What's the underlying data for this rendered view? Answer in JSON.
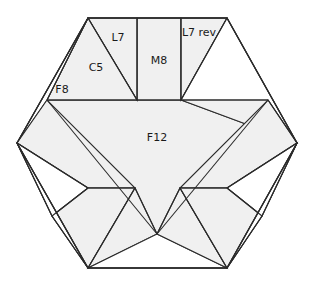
{
  "diagram": {
    "type": "hexagon-patchwork",
    "canvas": {
      "width": 314,
      "height": 287
    },
    "colors": {
      "background": "#ffffff",
      "piece_fill": "#f0f0f0",
      "piece_blank": "#ffffff",
      "stroke": "#2b2b2b",
      "label_text": "#1a1a1a"
    },
    "hexagon": {
      "center": {
        "x": 157,
        "y": 143
      },
      "vertices": [
        {
          "name": "left",
          "x": 17,
          "y": 143
        },
        {
          "name": "top-left",
          "x": 88,
          "y": 18
        },
        {
          "name": "top-right",
          "x": 227,
          "y": 18
        },
        {
          "name": "right",
          "x": 297,
          "y": 143
        },
        {
          "name": "bottom-right",
          "x": 227,
          "y": 268
        },
        {
          "name": "bottom-left",
          "x": 88,
          "y": 268
        }
      ]
    },
    "labels": [
      {
        "id": "l7",
        "text": "L7",
        "x": 118,
        "y": 38,
        "font_size": 11
      },
      {
        "id": "m8",
        "text": "M8",
        "x": 159,
        "y": 61,
        "font_size": 11
      },
      {
        "id": "l7rev",
        "text": "L7 rev",
        "x": 199,
        "y": 33,
        "font_size": 11
      },
      {
        "id": "c5",
        "text": "C5",
        "x": 96,
        "y": 68,
        "font_size": 11
      },
      {
        "id": "f8",
        "text": "F8",
        "x": 62,
        "y": 90,
        "font_size": 11
      },
      {
        "id": "f12",
        "text": "F12",
        "x": 157,
        "y": 138,
        "font_size": 11
      }
    ],
    "pieces": [
      {
        "id": "f12-center",
        "name": "F12 center triangle",
        "fill": "filled",
        "points": "47,100 268,100 157,234"
      },
      {
        "id": "m8-rect",
        "name": "M8 rectangle",
        "fill": "filled",
        "points": "137,18 181,18 181,100 137,100"
      },
      {
        "id": "l7-tri",
        "name": "L7 triangle",
        "fill": "filled",
        "points": "88,18 137,18 137,100"
      },
      {
        "id": "l7rev-tri",
        "name": "L7 reverse triangle",
        "fill": "filled",
        "points": "181,18 227,18 181,100"
      },
      {
        "id": "c5-tri",
        "name": "C5 triangle",
        "fill": "filled",
        "points": "88,18 137,100 47,100"
      },
      {
        "id": "f8-tri",
        "name": "F8 triangle",
        "fill": "blank",
        "points": "17,143 88,18 47,100"
      },
      {
        "id": "top-right-blank",
        "name": "top right blank wedge",
        "fill": "blank",
        "points": "227,18 297,143 181,100"
      },
      {
        "id": "tr-filled",
        "name": "top right filled wedge",
        "fill": "filled",
        "points": "181,100 297,143 268,100"
      },
      {
        "id": "left-band",
        "name": "left band",
        "fill": "filled",
        "points": "17,143 47,100 135,188 88,188"
      },
      {
        "id": "left-blank-1",
        "name": "left blank wedge 1",
        "fill": "blank",
        "points": "17,143 88,188 52,216"
      },
      {
        "id": "left-band-2",
        "name": "left band 2",
        "fill": "filled",
        "points": "52,216 88,188 135,188 88,268"
      },
      {
        "id": "left-blank-2",
        "name": "left blank wedge 2",
        "fill": "blank",
        "points": "52,216 88,268 17,143"
      },
      {
        "id": "bot-left-fill",
        "name": "bottom left fill",
        "fill": "filled",
        "points": "88,268 135,188 157,234"
      },
      {
        "id": "bot-center-blank",
        "name": "bottom center blank",
        "fill": "blank",
        "points": "88,268 157,234 227,268"
      },
      {
        "id": "bot-right-fill",
        "name": "bottom right fill",
        "fill": "filled",
        "points": "227,268 157,234 180,188"
      },
      {
        "id": "right-band",
        "name": "right band",
        "fill": "filled",
        "points": "297,143 268,100 180,188 227,188"
      },
      {
        "id": "right-blank-1",
        "name": "right blank wedge 1",
        "fill": "blank",
        "points": "297,143 227,188 262,216"
      },
      {
        "id": "right-band-2",
        "name": "right band 2",
        "fill": "filled",
        "points": "262,216 227,188 180,188 227,268"
      },
      {
        "id": "right-blank-2",
        "name": "right blank wedge 2",
        "fill": "blank",
        "points": "262,216 227,268 297,143"
      }
    ],
    "edges": [
      {
        "id": "e-hex",
        "points": "17,143 88,18 227,18 297,143 227,268 88,268 17,143"
      },
      {
        "id": "e-mid-horizontal",
        "points": "47,100 268,100"
      },
      {
        "id": "e-f12-left",
        "points": "47,100 157,234"
      },
      {
        "id": "e-f12-right",
        "points": "268,100 157,234"
      },
      {
        "id": "e-m8-left",
        "points": "137,18 137,100"
      },
      {
        "id": "e-m8-right",
        "points": "181,18 181,100"
      },
      {
        "id": "e-l7-diag",
        "points": "88,18 137,100"
      },
      {
        "id": "e-l7rev-diag",
        "points": "227,18 181,100"
      },
      {
        "id": "e-c5-left",
        "points": "47,100 88,18"
      },
      {
        "id": "e-tr-diag",
        "points": "268,100 297,143"
      },
      {
        "id": "e-left-band-top",
        "points": "17,143 88,188"
      },
      {
        "id": "e-left-band-inner",
        "points": "88,188 135,188"
      },
      {
        "id": "e-left-fold-1",
        "points": "17,143 52,216"
      },
      {
        "id": "e-left-fold-2",
        "points": "52,216 88,188"
      },
      {
        "id": "e-left-fold-3",
        "points": "52,216 88,268"
      },
      {
        "id": "e-left-spoke",
        "points": "88,268 135,188"
      },
      {
        "id": "e-center-spoke-left",
        "points": "135,188 157,234"
      },
      {
        "id": "e-center-spoke-right",
        "points": "180,188 157,234"
      },
      {
        "id": "e-right-spoke",
        "points": "227,268 180,188"
      },
      {
        "id": "e-right-band-top",
        "points": "297,143 227,188"
      },
      {
        "id": "e-right-band-inner",
        "points": "227,188 180,188"
      },
      {
        "id": "e-right-fold-1",
        "points": "297,143 262,216"
      },
      {
        "id": "e-right-fold-2",
        "points": "262,216 227,188"
      },
      {
        "id": "e-right-fold-3",
        "points": "262,216 227,268"
      }
    ]
  }
}
